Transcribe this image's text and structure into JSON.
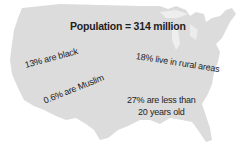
{
  "map": {
    "region": "United States",
    "fill_color": "#dcdcdc",
    "background_color": "#ffffff",
    "text_color": "#1e1e1e"
  },
  "title": "Population = 314 million",
  "facts": [
    {
      "text": "13% are black"
    },
    {
      "text": "18% live in rural areas"
    },
    {
      "text": "0.6% are Muslim"
    },
    {
      "line1": "27% are less than",
      "line2": "20 years old"
    }
  ]
}
